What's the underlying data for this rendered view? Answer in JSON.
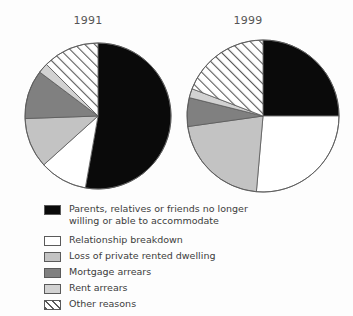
{
  "figure": {
    "background_color": "#fdfdfd",
    "titles": [
      {
        "id": "title-1991",
        "text": "1991"
      },
      {
        "id": "title-1999",
        "text": "1999"
      }
    ]
  },
  "colors": {
    "black": "#0a0a0a",
    "white": "#ffffff",
    "light_grey": "#c3c3c3",
    "dark_grey": "#808080",
    "pale_grey": "#d2d2d2",
    "hatch_line": "#5a5a5a",
    "outline": "#5a5a5a",
    "text": "#3c3c3c",
    "title_text": "#555555"
  },
  "legend": {
    "items": [
      {
        "key": "parents",
        "label": "Parents, relatives or friends no longer\nwilling or able to accommodate",
        "swatch": "solid-black-swatch",
        "fill": "#0a0a0a",
        "pattern": "solid",
        "multiline": true
      },
      {
        "key": "relationship",
        "label": "Relationship breakdown",
        "swatch": "solid-white-swatch",
        "fill": "#ffffff",
        "pattern": "solid",
        "multiline": false
      },
      {
        "key": "loss_rented",
        "label": "Loss of private rented dwelling",
        "swatch": "light-grey-swatch",
        "fill": "#c3c3c3",
        "pattern": "solid",
        "multiline": false
      },
      {
        "key": "mortgage",
        "label": "Mortgage arrears",
        "swatch": "dark-grey-swatch",
        "fill": "#808080",
        "pattern": "solid",
        "multiline": false
      },
      {
        "key": "rent",
        "label": "Rent arrears",
        "swatch": "pale-grey-swatch",
        "fill": "#d2d2d2",
        "pattern": "solid",
        "multiline": false
      },
      {
        "key": "other",
        "label": "Other reasons",
        "swatch": "hatched-swatch",
        "fill": "#ffffff",
        "pattern": "diagonal-hatch",
        "multiline": false
      }
    ]
  },
  "chart_data": [
    {
      "type": "pie",
      "title": "1991",
      "center": {
        "x": 98,
        "y": 116
      },
      "radius": 73,
      "start_angle_deg": 0,
      "direction": "clockwise",
      "categories": [
        "Parents, relatives or friends no longer willing or able to accommodate",
        "Relationship breakdown",
        "Loss of private rented dwelling",
        "Mortgage arrears",
        "Rent arrears",
        "Other reasons"
      ],
      "values": [
        53,
        10,
        11,
        11,
        2,
        13
      ],
      "unit": "percent",
      "slices": [
        {
          "key": "parents",
          "label": "Parents, relatives or friends no longer willing or able to accommodate",
          "value": 53,
          "start_deg": 0,
          "end_deg": 190,
          "fill": "#0a0a0a",
          "pattern": "solid"
        },
        {
          "key": "relationship",
          "label": "Relationship breakdown",
          "value": 10,
          "start_deg": 190,
          "end_deg": 228,
          "fill": "#ffffff",
          "pattern": "solid"
        },
        {
          "key": "loss_rented",
          "label": "Loss of private rented dwelling",
          "value": 11,
          "start_deg": 228,
          "end_deg": 268,
          "fill": "#c3c3c3",
          "pattern": "solid"
        },
        {
          "key": "mortgage",
          "label": "Mortgage arrears",
          "value": 11,
          "start_deg": 268,
          "end_deg": 307,
          "fill": "#808080",
          "pattern": "solid"
        },
        {
          "key": "rent",
          "label": "Rent arrears",
          "value": 2,
          "start_deg": 307,
          "end_deg": 315,
          "fill": "#d2d2d2",
          "pattern": "solid"
        },
        {
          "key": "other",
          "label": "Other reasons",
          "value": 13,
          "start_deg": 315,
          "end_deg": 360,
          "fill": "#ffffff",
          "pattern": "diagonal-hatch"
        }
      ]
    },
    {
      "type": "pie",
      "title": "1999",
      "center": {
        "x": 263,
        "y": 116
      },
      "radius": 76,
      "start_angle_deg": 0,
      "direction": "clockwise",
      "categories": [
        "Parents, relatives or friends no longer willing or able to accommodate",
        "Relationship breakdown",
        "Loss of private rented dwelling",
        "Mortgage arrears",
        "Rent arrears",
        "Other reasons"
      ],
      "values": [
        25,
        26,
        21,
        6,
        2,
        19
      ],
      "unit": "percent",
      "slices": [
        {
          "key": "parents",
          "label": "Parents, relatives or friends no longer willing or able to accommodate",
          "value": 25,
          "start_deg": 0,
          "end_deg": 90,
          "fill": "#0a0a0a",
          "pattern": "solid"
        },
        {
          "key": "relationship",
          "label": "Relationship breakdown",
          "value": 26,
          "start_deg": 90,
          "end_deg": 185,
          "fill": "#ffffff",
          "pattern": "solid"
        },
        {
          "key": "loss_rented",
          "label": "Loss of private rented dwelling",
          "value": 21,
          "start_deg": 185,
          "end_deg": 262,
          "fill": "#c3c3c3",
          "pattern": "solid"
        },
        {
          "key": "mortgage",
          "label": "Mortgage arrears",
          "value": 6,
          "start_deg": 262,
          "end_deg": 284,
          "fill": "#808080",
          "pattern": "solid"
        },
        {
          "key": "rent",
          "label": "Rent arrears",
          "value": 2,
          "start_deg": 284,
          "end_deg": 291,
          "fill": "#d2d2d2",
          "pattern": "solid"
        },
        {
          "key": "other",
          "label": "Other reasons",
          "value": 19,
          "start_deg": 291,
          "end_deg": 360,
          "fill": "#ffffff",
          "pattern": "diagonal-hatch"
        }
      ]
    }
  ]
}
